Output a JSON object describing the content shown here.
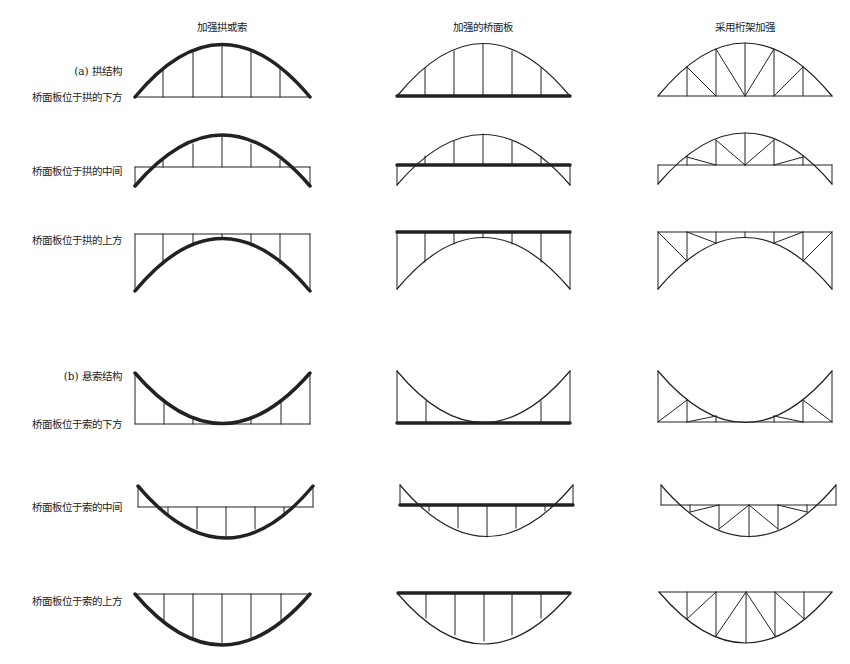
{
  "columns": [
    {
      "title": "加强拱或索",
      "center_x": 222
    },
    {
      "title": "加强的桥面板",
      "center_x": 483
    },
    {
      "title": "采用桁架加强",
      "center_x": 745
    }
  ],
  "sections": {
    "a": {
      "label": "(a) 拱结构"
    },
    "b": {
      "label": "(b) 悬索结构"
    }
  },
  "rows": [
    {
      "label": "桥面板位于拱的下方"
    },
    {
      "label": "桥面板位于拱的中间"
    },
    {
      "label": "桥面板位于拱的上方"
    },
    {
      "label": "桥面板位于索的下方"
    },
    {
      "label": "桥面板位于索的中间"
    },
    {
      "label": "桥面板位于索的上方"
    }
  ],
  "colors": {
    "line": "#222222",
    "background": "#ffffff"
  }
}
